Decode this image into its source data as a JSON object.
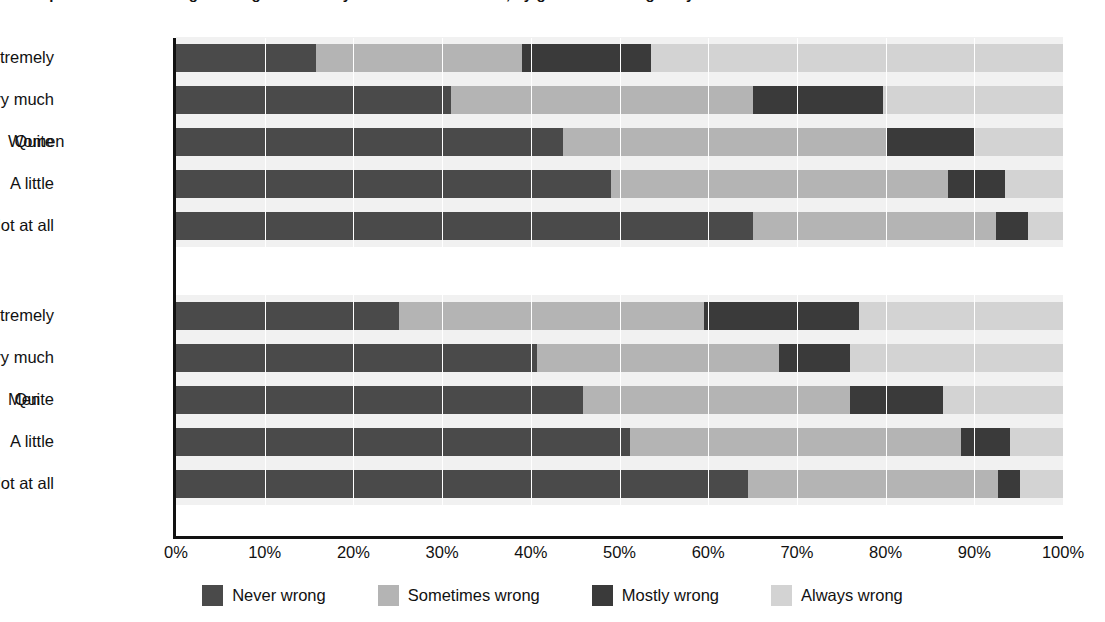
{
  "chart_data": {
    "type": "bar",
    "orientation": "horizontal",
    "stacked": true,
    "stack_mode": "percent",
    "title": "Perceptions of how wrong it is to get a sexually transmitted infection, by gender and religiosity",
    "xlabel": "",
    "ylabel": "",
    "xlim": [
      0,
      100
    ],
    "xticks": [
      "0%",
      "10%",
      "20%",
      "30%",
      "40%",
      "50%",
      "60%",
      "70%",
      "80%",
      "90%",
      "100%"
    ],
    "xtick_values": [
      0,
      10,
      20,
      30,
      40,
      50,
      60,
      70,
      80,
      90,
      100
    ],
    "grid": true,
    "legend_position": "bottom",
    "legend": [
      "Never wrong",
      "Sometimes wrong",
      "Mostly wrong",
      "Always wrong"
    ],
    "series_colors": [
      "#4a4a4a",
      "#b4b4b4",
      "#3a3a3a",
      "#d3d3d3"
    ],
    "groups": [
      {
        "name": "Women",
        "categories": [
          "Extremely",
          "Very much",
          "Quite",
          "A little",
          "Not at all"
        ],
        "rows": [
          {
            "label": "Extremely",
            "values": [
              15.8,
              23.2,
              14.5,
              46.5
            ]
          },
          {
            "label": "Very much",
            "values": [
              31.0,
              34.0,
              14.7,
              20.3
            ]
          },
          {
            "label": "Quite",
            "values": [
              43.6,
              36.4,
              10.0,
              10.0
            ]
          },
          {
            "label": "A little",
            "values": [
              49.0,
              38.0,
              6.5,
              6.5
            ]
          },
          {
            "label": "Not at all",
            "values": [
              65.0,
              27.5,
              3.5,
              4.0
            ]
          }
        ]
      },
      {
        "name": "Men",
        "categories": [
          "Extremely",
          "Very much",
          "Quite",
          "A little",
          "Not at all"
        ],
        "rows": [
          {
            "label": "Extremely",
            "values": [
              25.1,
              34.4,
              17.5,
              23.0
            ]
          },
          {
            "label": "Very much",
            "values": [
              40.7,
              27.3,
              8.0,
              24.0
            ]
          },
          {
            "label": "Quite",
            "values": [
              45.9,
              30.1,
              10.5,
              13.5
            ]
          },
          {
            "label": "A little",
            "values": [
              51.2,
              37.3,
              5.5,
              6.0
            ]
          },
          {
            "label": "Not at all",
            "values": [
              64.5,
              28.2,
              2.5,
              4.8
            ]
          }
        ]
      }
    ]
  },
  "axis": {
    "ticks": [
      {
        "label": "0%",
        "value": 0
      },
      {
        "label": "10%",
        "value": 10
      },
      {
        "label": "20%",
        "value": 20
      },
      {
        "label": "30%",
        "value": 30
      },
      {
        "label": "40%",
        "value": 40
      },
      {
        "label": "50%",
        "value": 50
      },
      {
        "label": "60%",
        "value": 60
      },
      {
        "label": "70%",
        "value": 70
      },
      {
        "label": "80%",
        "value": 80
      },
      {
        "label": "90%",
        "value": 90
      },
      {
        "label": "100%",
        "value": 100
      }
    ]
  },
  "legend": {
    "items": [
      {
        "label": "Never wrong",
        "color": "#4a4a4a"
      },
      {
        "label": "Sometimes wrong",
        "color": "#b4b4b4"
      },
      {
        "label": "Mostly wrong",
        "color": "#3a3a3a"
      },
      {
        "label": "Always wrong",
        "color": "#d3d3d3"
      }
    ]
  },
  "group_labels": [
    "Women",
    "Men"
  ]
}
